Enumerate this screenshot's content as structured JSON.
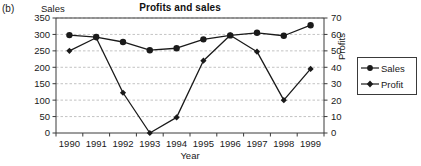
{
  "panel": {
    "label": "(b)"
  },
  "chart_data": {
    "type": "line",
    "title": "Profits and sales",
    "xlabel": "Year",
    "ylabel": "Sales",
    "y2label": "Profits",
    "categories": [
      "1990",
      "1991",
      "1992",
      "1993",
      "1994",
      "1995",
      "1996",
      "1997",
      "1998",
      "1999"
    ],
    "ylim": [
      0,
      350
    ],
    "yticks": [
      0,
      50,
      100,
      150,
      200,
      250,
      300,
      350
    ],
    "y2lim": [
      0,
      70
    ],
    "y2ticks": [
      0,
      10,
      20,
      30,
      40,
      50,
      60,
      70
    ],
    "grid": true,
    "legend_position": "right",
    "series": [
      {
        "name": "Sales",
        "axis": "left",
        "marker": "circle",
        "color": "#1a1a1a",
        "values": [
          298,
          292,
          277,
          252,
          258,
          285,
          297,
          305,
          296,
          328
        ]
      },
      {
        "name": "Profit",
        "axis": "right",
        "marker": "diamond",
        "color": "#1a1a1a",
        "values": [
          50,
          58,
          24.5,
          0,
          9.5,
          44,
          59.5,
          49.5,
          20,
          39
        ]
      }
    ]
  },
  "legend": {
    "items": [
      {
        "label": "Sales",
        "marker": "circle"
      },
      {
        "label": "Profit",
        "marker": "diamond"
      }
    ]
  },
  "colors": {
    "line": "#1a1a1a",
    "grid": "#b4b4b4",
    "axis": "#3a3a3a",
    "background": "#ffffff"
  }
}
